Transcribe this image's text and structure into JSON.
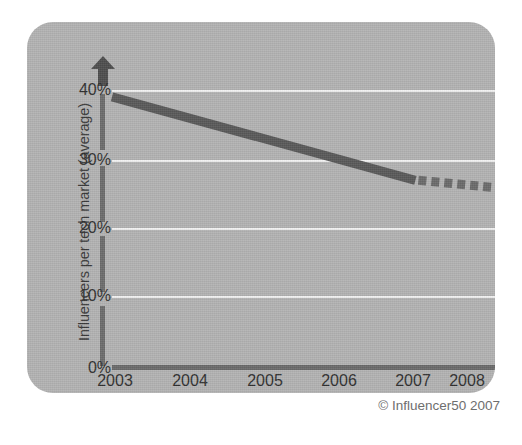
{
  "chart_data": {
    "type": "line",
    "title": "",
    "subtitle": "",
    "xlabel": "",
    "ylabel": "Influencers per tech market (average)",
    "x": [
      "2003",
      "2004",
      "2005",
      "2006",
      "2007",
      "2008"
    ],
    "categories": [
      "2003",
      "2004",
      "2005",
      "2006",
      "2007",
      "2008"
    ],
    "series": [
      {
        "name": "Influencers per tech market (actual)",
        "style": "solid",
        "values": [
          39,
          36,
          33,
          30,
          27,
          null
        ]
      },
      {
        "name": "Influencers per tech market (forecast)",
        "style": "dashed",
        "values": [
          null,
          null,
          null,
          null,
          27,
          26
        ]
      }
    ],
    "values": [
      39,
      36,
      33,
      30,
      27,
      26
    ],
    "ylim": [
      0,
      44
    ],
    "xlim": [
      "2003",
      "2008"
    ],
    "ytick_labels": [
      "0%",
      "10%",
      "20%",
      "30%",
      "40%"
    ],
    "ytick_values": [
      0,
      10,
      20,
      30,
      40
    ],
    "gridlines": "horizontal",
    "grid": true,
    "legend": "none",
    "annotations": [
      "© Influencer50 2007"
    ]
  },
  "axes": {
    "y_title": "Influencers per tech market (average)",
    "y_arrow": "up-arrow",
    "ticks_y": [
      {
        "label": "40%",
        "value": 40
      },
      {
        "label": "30%",
        "value": 30
      },
      {
        "label": "20%",
        "value": 20
      },
      {
        "label": "10%",
        "value": 10
      },
      {
        "label": "0%",
        "value": 0
      }
    ],
    "ticks_x": [
      {
        "label": "2003"
      },
      {
        "label": "2004"
      },
      {
        "label": "2005"
      },
      {
        "label": "2006"
      },
      {
        "label": "2007"
      },
      {
        "label": "2008"
      }
    ]
  },
  "footer": {
    "copyright": "© Influencer50 2007"
  },
  "colors": {
    "panel_background": "#b3b3b3",
    "page_background": "#ffffff",
    "gridline": "#f2f2f2",
    "axis": "#6d6d6d",
    "baseline": "#6a6a6a",
    "series_line": "#595959",
    "forecast_line": "#6b6b6b",
    "tick_text": "#2f2f2f",
    "title_text": "#3a3a3a",
    "copyright_text": "#6e6e6e"
  }
}
